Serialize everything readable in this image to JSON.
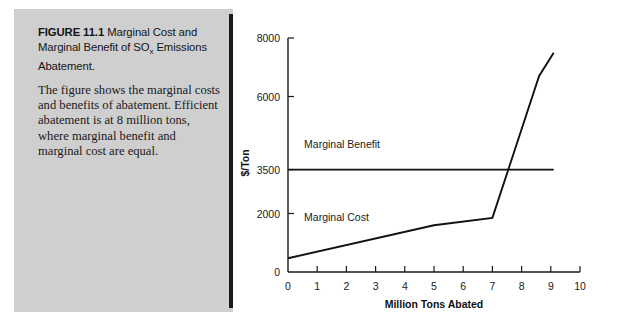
{
  "figure": {
    "label": "FIGURE 11.1",
    "title_rest": " Marginal Cost and Marginal Benefit of SO",
    "title_sub": "x",
    "title_tail": " Emissions Abatement.",
    "description": "The figure shows the marginal costs and benefits of abatement. Efficient abatement is at 8 million tons, where marginal benefit and marginal cost are equal."
  },
  "colors": {
    "panel_gray": "#cfcfcf",
    "frame_gray": "#d6d6d6",
    "ink": "#111111",
    "page_white": "#ffffff"
  },
  "chart_data": {
    "type": "line",
    "title": "",
    "xlabel": "Million Tons Abated",
    "ylabel": "$/Ton",
    "xlim": [
      0,
      10
    ],
    "ylim": [
      0,
      8000
    ],
    "grid": false,
    "legend_position": "inline-annotation",
    "xticks": [
      0,
      1,
      2,
      3,
      4,
      5,
      6,
      7,
      8,
      9,
      10
    ],
    "xtick_labels": [
      "0",
      "1",
      "2",
      "3",
      "4",
      "5",
      "6",
      "7",
      "8",
      "9",
      "10"
    ],
    "yticks": [
      0,
      2000,
      3500,
      6000,
      8000
    ],
    "ytick_labels": [
      "0",
      "2000",
      "3500",
      "6000",
      "8000"
    ],
    "series": [
      {
        "name": "Marginal Benefit",
        "label_x": 0.55,
        "label_y": 4250,
        "x": [
          0,
          9.1
        ],
        "y": [
          3500,
          3500
        ]
      },
      {
        "name": "Marginal Cost",
        "label_x": 0.55,
        "label_y": 1750,
        "x": [
          0,
          5.0,
          7.0,
          8.6,
          9.1
        ],
        "y": [
          470,
          1600,
          1850,
          6700,
          7500
        ]
      }
    ],
    "annotations": [
      {
        "text": "Efficient abatement",
        "x": 8,
        "y": 3500,
        "visible": false
      }
    ]
  }
}
